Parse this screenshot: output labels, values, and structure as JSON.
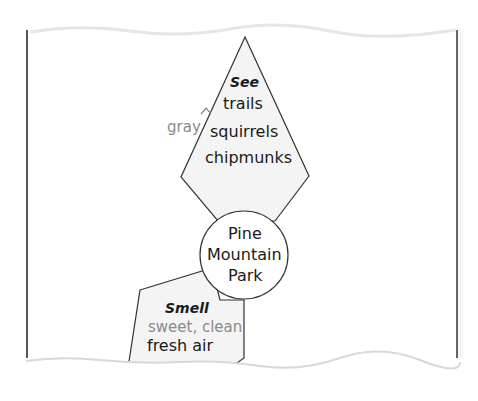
{
  "diagram": {
    "center": {
      "lines": [
        "Pine",
        "Mountain",
        "Park"
      ]
    },
    "see": {
      "heading": "See",
      "items": [
        "trails",
        "squirrels",
        "chipmunks"
      ],
      "insertion": "gray"
    },
    "smell": {
      "heading": "Smell",
      "insertion": "sweet, clean",
      "items": [
        "fresh air"
      ]
    }
  },
  "colors": {
    "line": "#333333",
    "fill": "#f3f3f3",
    "insert_text": "#8a8a8a"
  }
}
